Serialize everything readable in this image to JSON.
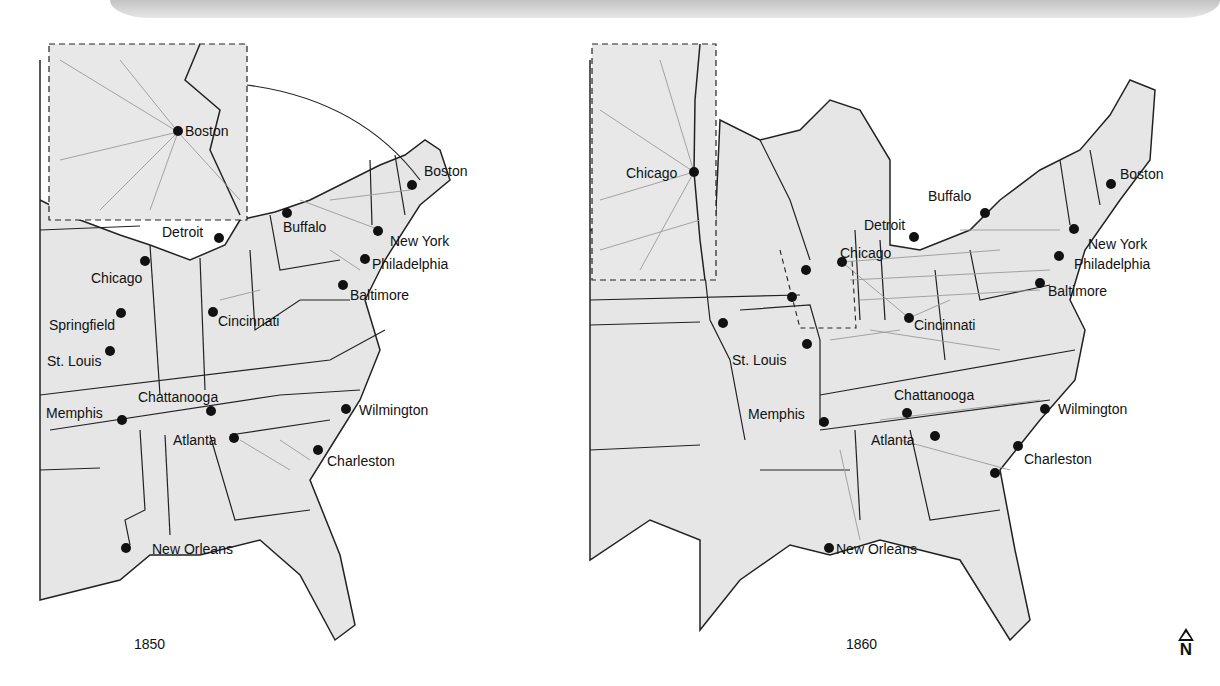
{
  "figure": {
    "panels": [
      {
        "year": "1850",
        "inset_city": "Boston",
        "cities": [
          {
            "name": "Boston",
            "x": 412,
            "y": 185,
            "lx": 424,
            "ly": 163
          },
          {
            "name": "Detroit",
            "x": 219,
            "y": 238,
            "lx": 162,
            "ly": 224
          },
          {
            "name": "Buffalo",
            "x": 287,
            "y": 213,
            "lx": 283,
            "ly": 219
          },
          {
            "name": "New York",
            "x": 378,
            "y": 231,
            "lx": 390,
            "ly": 233
          },
          {
            "name": "Philadelphia",
            "x": 365,
            "y": 259,
            "lx": 372,
            "ly": 256
          },
          {
            "name": "Baltimore",
            "x": 343,
            "y": 285,
            "lx": 350,
            "ly": 287
          },
          {
            "name": "Chicago",
            "x": 145,
            "y": 261,
            "lx": 91,
            "ly": 270
          },
          {
            "name": "Springfield",
            "x": 121,
            "y": 313,
            "lx": 49,
            "ly": 317
          },
          {
            "name": "St. Louis",
            "x": 110,
            "y": 351,
            "lx": 47,
            "ly": 353
          },
          {
            "name": "Cincinnati",
            "x": 213,
            "y": 312,
            "lx": 218,
            "ly": 313
          },
          {
            "name": "Chattanooga",
            "x": 211,
            "y": 411,
            "lx": 138,
            "ly": 389
          },
          {
            "name": "Memphis",
            "x": 122,
            "y": 420,
            "lx": 46,
            "ly": 405
          },
          {
            "name": "Atlanta",
            "x": 234,
            "y": 438,
            "lx": 173,
            "ly": 432
          },
          {
            "name": "Wilmington",
            "x": 346,
            "y": 409,
            "lx": 359,
            "ly": 402
          },
          {
            "name": "Charleston",
            "x": 318,
            "y": 450,
            "lx": 327,
            "ly": 453
          },
          {
            "name": "New Orleans",
            "x": 126,
            "y": 548,
            "lx": 152,
            "ly": 541
          }
        ]
      },
      {
        "year": "1860",
        "inset_city": "Chicago",
        "cities": [
          {
            "name": "Chicago",
            "x": 694,
            "y": 172,
            "lx": 626,
            "ly": 165
          },
          {
            "name": "Boston",
            "x": 1111,
            "y": 184,
            "lx": 1120,
            "ly": 166
          },
          {
            "name": "Buffalo",
            "x": 985,
            "y": 213,
            "lx": 928,
            "ly": 188
          },
          {
            "name": "Detroit",
            "x": 914,
            "y": 237,
            "lx": 864,
            "ly": 217
          },
          {
            "name": "Chicago",
            "x": 842,
            "y": 262,
            "lx": 840,
            "ly": 245
          },
          {
            "name": "New York",
            "x": 1074,
            "y": 229,
            "lx": 1088,
            "ly": 236
          },
          {
            "name": "Philadelphia",
            "x": 1059,
            "y": 256,
            "lx": 1074,
            "ly": 256
          },
          {
            "name": "Baltimore",
            "x": 1040,
            "y": 283,
            "lx": 1048,
            "ly": 283
          },
          {
            "name": "Cincinnati",
            "x": 909,
            "y": 318,
            "lx": 914,
            "ly": 317
          },
          {
            "name": "St. Louis",
            "x": 807,
            "y": 344,
            "lx": 732,
            "ly": 352
          },
          {
            "name": "Memphis",
            "x": 824,
            "y": 422,
            "lx": 748,
            "ly": 406
          },
          {
            "name": "Chattanooga",
            "x": 907,
            "y": 413,
            "lx": 894,
            "ly": 387
          },
          {
            "name": "Atlanta",
            "x": 935,
            "y": 436,
            "lx": 871,
            "ly": 432
          },
          {
            "name": "Wilmington",
            "x": 1045,
            "y": 409,
            "lx": 1058,
            "ly": 401
          },
          {
            "name": "Charleston",
            "x": 1018,
            "y": 446,
            "lx": 1024,
            "ly": 451
          },
          {
            "name": "New Orleans",
            "x": 829,
            "y": 548,
            "lx": 836,
            "ly": 541
          }
        ],
        "extra_dots": [
          {
            "x": 806,
            "y": 270
          },
          {
            "x": 792,
            "y": 297
          },
          {
            "x": 723,
            "y": 323
          },
          {
            "x": 995,
            "y": 473
          }
        ]
      }
    ],
    "compass": {
      "label": "N"
    }
  }
}
